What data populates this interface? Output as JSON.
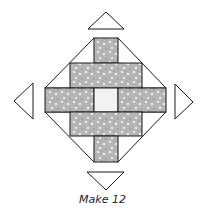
{
  "diagram": {
    "caption": "Make 12",
    "colors": {
      "fabric": "#b5b5b5",
      "center": "#f2f2f2",
      "outline": "#1a1a1a",
      "background": "#ffffff"
    },
    "pieces": [
      {
        "name": "top-bar",
        "fill": "fabric"
      },
      {
        "name": "upper-block",
        "fill": "fabric"
      },
      {
        "name": "left-band",
        "fill": "fabric"
      },
      {
        "name": "center-square",
        "fill": "center"
      },
      {
        "name": "right-band",
        "fill": "fabric"
      },
      {
        "name": "lower-block",
        "fill": "fabric"
      },
      {
        "name": "bottom-bar",
        "fill": "fabric"
      },
      {
        "name": "top-triangle",
        "fill": "background"
      },
      {
        "name": "left-triangle",
        "fill": "background"
      },
      {
        "name": "right-triangle",
        "fill": "background"
      },
      {
        "name": "bottom-triangle",
        "fill": "background"
      }
    ]
  }
}
